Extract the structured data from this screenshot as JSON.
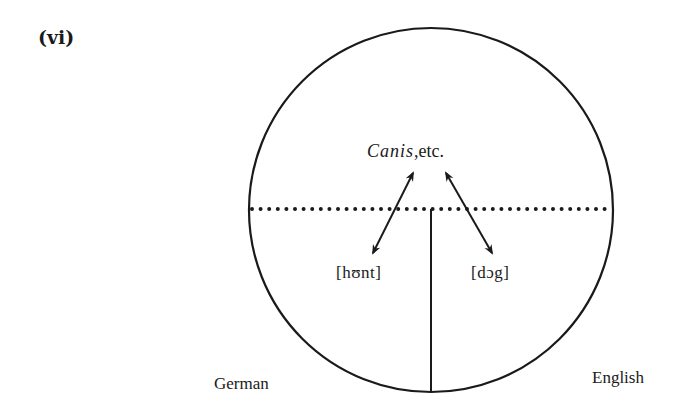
{
  "figure": {
    "label": "(vi)"
  },
  "diagram": {
    "concept": {
      "italic": "Canis",
      "rest": ",etc."
    },
    "left_form": "[hʊnt]",
    "right_form": "[dɔg]",
    "left_language": "German",
    "right_language": "English",
    "shapes": {
      "circle": {
        "cx": 431,
        "cy": 210,
        "r": 182
      },
      "dotted_divider": {
        "x1": 252,
        "x2": 611,
        "y": 209
      },
      "vertical_divider": {
        "x": 431,
        "y1": 209,
        "y2": 392
      },
      "arrow_left": {
        "x1": 413,
        "y1": 173,
        "x2": 373,
        "y2": 253
      },
      "arrow_right": {
        "x1": 446,
        "y1": 173,
        "x2": 492,
        "y2": 253
      }
    },
    "colors": {
      "ink": "#1a1a1a",
      "background": "#ffffff"
    }
  }
}
